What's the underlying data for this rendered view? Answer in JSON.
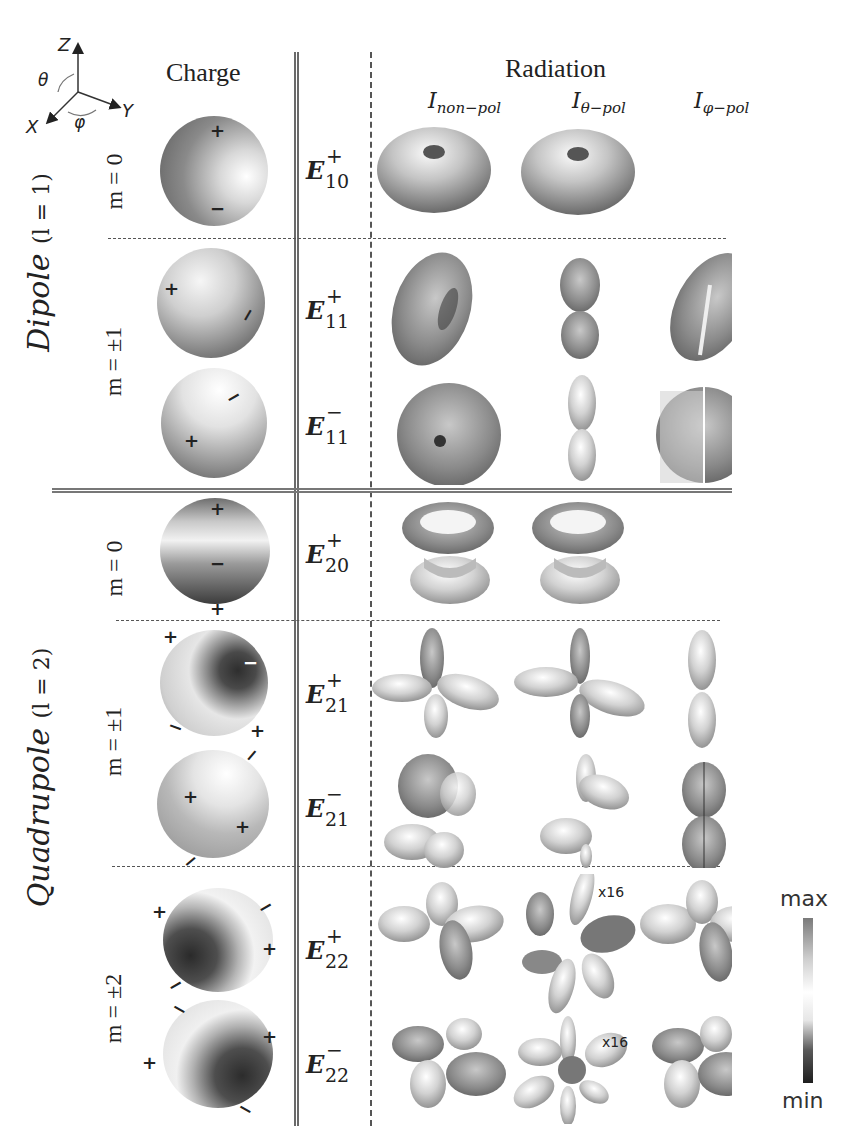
{
  "figure": {
    "headers": {
      "charge": "Charge",
      "radiation": "Radiation"
    },
    "radiation_columns": [
      {
        "symbol": "I",
        "subscript": "non−pol"
      },
      {
        "symbol": "I",
        "subscript": "θ−pol"
      },
      {
        "symbol": "I",
        "subscript": "φ−pol"
      }
    ],
    "axes": {
      "z": "Z",
      "y": "Y",
      "x": "X",
      "theta": "θ",
      "phi": "φ"
    },
    "groups": [
      {
        "name": "Dipole",
        "l_label": "(l = 1)",
        "m_rows": [
          "m = 0",
          "m = ±1"
        ]
      },
      {
        "name": "Quadrupole",
        "l_label": "(l = 2)",
        "m_rows": [
          "m = 0",
          "m = ±1",
          "m = ±2"
        ]
      }
    ],
    "modes": [
      {
        "label": "E",
        "sup": "+",
        "sub": "10",
        "charge_marks": [
          "+",
          "−"
        ],
        "patterns": [
          "donut",
          "donut",
          ""
        ]
      },
      {
        "label": "E",
        "sup": "+",
        "sub": "11",
        "charge_marks": [
          "+",
          "−"
        ],
        "patterns": [
          "tilted-donut",
          "two-lobe",
          "split-donut"
        ]
      },
      {
        "label": "E",
        "sup": "−",
        "sub": "11",
        "charge_marks": [
          "+",
          "−"
        ],
        "patterns": [
          "tilted-donut",
          "two-lobe",
          "split-donut"
        ]
      },
      {
        "label": "E",
        "sup": "+",
        "sub": "20",
        "charge_marks": [
          "+",
          "−",
          "+"
        ],
        "patterns": [
          "double-cone",
          "double-cone",
          ""
        ]
      },
      {
        "label": "E",
        "sup": "+",
        "sub": "21",
        "charge_marks": [
          "+",
          "−",
          "−",
          "+"
        ],
        "patterns": [
          "four-lobe",
          "four-lobe",
          "two-lobe"
        ]
      },
      {
        "label": "E",
        "sup": "−",
        "sub": "21",
        "charge_marks": [
          "−",
          "+",
          "+",
          "−"
        ],
        "patterns": [
          "four-lobe",
          "four-lobe",
          "two-lobe"
        ]
      },
      {
        "label": "E",
        "sup": "+",
        "sub": "22",
        "charge_marks": [
          "+",
          "−",
          "+",
          "−"
        ],
        "patterns": [
          "clover",
          "six-lobe x16",
          "clover"
        ]
      },
      {
        "label": "E",
        "sup": "−",
        "sub": "22",
        "charge_marks": [
          "−",
          "+",
          "+",
          "−"
        ],
        "patterns": [
          "clover",
          "six-lobe x16",
          "clover"
        ]
      }
    ],
    "annotations": {
      "scale_1": "x16",
      "scale_2": "x16"
    },
    "colorbar": {
      "max_label": "max",
      "min_label": "min",
      "colors": [
        "#7a7a7a",
        "#ffffff",
        "#1e1e1e"
      ]
    }
  }
}
